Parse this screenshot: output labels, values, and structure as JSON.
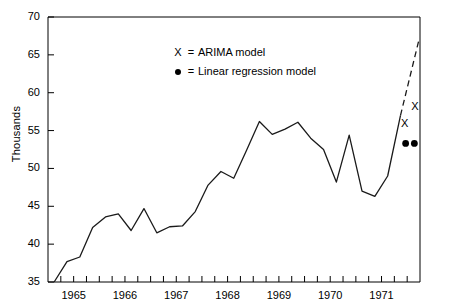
{
  "chart_data": {
    "type": "line",
    "title": "",
    "subtitle": "",
    "xlabel": "",
    "ylabel": "Thousands",
    "ylim": [
      35,
      70
    ],
    "xlim": [
      1964.5,
      1971.75
    ],
    "yticks": [
      35,
      40,
      45,
      50,
      55,
      60,
      65,
      70
    ],
    "ytick_labels": [
      "35",
      "40",
      "45",
      "50",
      "55",
      "60",
      "65",
      "70"
    ],
    "xticks": [
      1965,
      1966,
      1967,
      1968,
      1969,
      1970,
      1971
    ],
    "xtick_labels": [
      "1965",
      "1966",
      "1967",
      "1968",
      "1969",
      "1970",
      "1971"
    ],
    "minor_xticks_per_year": 4,
    "grid": false,
    "legend_position": "upper-center",
    "legend": [
      {
        "key": "X",
        "marker": "x",
        "equals": "=",
        "label": "ARIMA model"
      },
      {
        "key": "●",
        "marker": "dot",
        "equals": "=",
        "label": "Linear regression model"
      }
    ],
    "series": [
      {
        "name": "actual",
        "style": "solid",
        "x": [
          1964.62,
          1964.87,
          1965.12,
          1965.37,
          1965.62,
          1965.87,
          1966.12,
          1966.37,
          1966.62,
          1966.87,
          1967.12,
          1967.37,
          1967.62,
          1967.87,
          1968.12,
          1968.37,
          1968.62,
          1968.87,
          1969.12,
          1969.37,
          1969.62,
          1969.87,
          1970.12,
          1970.37,
          1970.62,
          1970.87,
          1971.12,
          1971.37
        ],
        "y": [
          35.0,
          37.7,
          38.3,
          42.2,
          43.6,
          44.0,
          41.8,
          44.7,
          41.5,
          42.3,
          42.4,
          44.3,
          47.8,
          49.6,
          48.7,
          52.4,
          56.2,
          54.5,
          55.2,
          56.1,
          54.0,
          52.5,
          48.2,
          54.4,
          47.0,
          46.3,
          49.0,
          57.0
        ]
      },
      {
        "name": "arima-forecast",
        "style": "dashed",
        "x": [
          1971.37,
          1971.73
        ],
        "y": [
          57.0,
          67.0
        ]
      }
    ],
    "point_markers": [
      {
        "series": "arima-forecast",
        "marker": "x",
        "x": 1971.45,
        "y": 56.0,
        "label": "X"
      },
      {
        "series": "arima-forecast",
        "marker": "x",
        "x": 1971.65,
        "y": 58.2,
        "label": "X"
      },
      {
        "series": "linear-regression",
        "marker": "dot",
        "x": 1971.47,
        "y": 53.3
      },
      {
        "series": "linear-regression",
        "marker": "dot",
        "x": 1971.64,
        "y": 53.3
      }
    ],
    "colors": {
      "line": "#1a1a1a",
      "axis": "#000000",
      "marker": "#000000",
      "background": "#ffffff"
    }
  }
}
